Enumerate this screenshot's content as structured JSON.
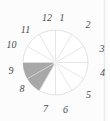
{
  "figure": {
    "type": "clock-face-pie",
    "total_sectors": 12,
    "labels": [
      "1",
      "2",
      "3",
      "4",
      "5",
      "6",
      "7",
      "8",
      "9",
      "10",
      "11",
      "12"
    ],
    "shaded_sectors": [
      "8",
      "9"
    ],
    "colors": {
      "shaded_wedge": "#a8a8a8",
      "grid_lines": "#dfdfdf",
      "number_text": "#4a4a4a",
      "background": "#fcfcfc",
      "page_edge_line": "#e9e9e9"
    }
  }
}
